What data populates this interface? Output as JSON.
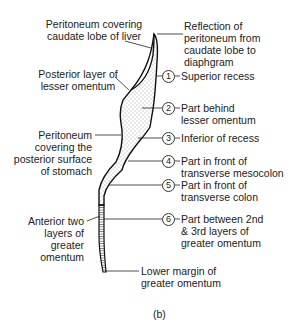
{
  "figure": {
    "caption": "(b)",
    "labels_left": [
      {
        "id": "caudate",
        "lines": [
          "Peritoneum covering",
          "caudate lobe of liver"
        ]
      },
      {
        "id": "posterior_lesser",
        "lines": [
          "Posterior layer of",
          "lesser omentum"
        ]
      },
      {
        "id": "stomach",
        "lines": [
          "Peritoneum",
          "covering the",
          "posterior surface",
          "of stomach"
        ]
      },
      {
        "id": "anterior_greater",
        "lines": [
          "Anterior two",
          "layers of",
          "greater",
          "omentum"
        ]
      }
    ],
    "labels_right": [
      {
        "id": "reflection",
        "lines": [
          "Reflection of",
          "peritoneum from",
          "caudate lobe to",
          "diaphgram"
        ]
      },
      {
        "id": "r1",
        "number": "1",
        "lines": [
          "Superior recess"
        ]
      },
      {
        "id": "r2",
        "number": "2",
        "lines": [
          "Part behind",
          "lesser omentum"
        ]
      },
      {
        "id": "r3",
        "number": "3",
        "lines": [
          "Inferior of recess"
        ]
      },
      {
        "id": "r4",
        "number": "4",
        "lines": [
          "Part in front of",
          "transverse mesocolon"
        ]
      },
      {
        "id": "r5",
        "number": "5",
        "lines": [
          "Part in front of",
          "transverse colon"
        ]
      },
      {
        "id": "r6",
        "number": "6",
        "lines": [
          "Part between 2nd",
          "& 3rd layers of",
          "greater omentum"
        ]
      },
      {
        "id": "lower",
        "lines": [
          "Lower margin of",
          "greater omentum"
        ]
      }
    ]
  }
}
